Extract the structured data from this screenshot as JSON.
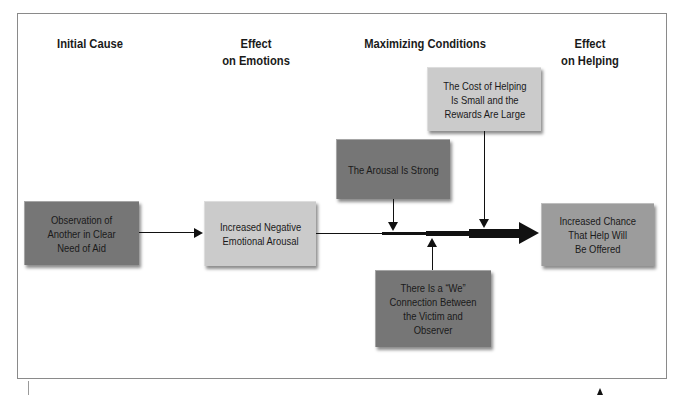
{
  "headers": {
    "initial_cause": "Initial Cause",
    "effect_on_emotions": "Effect\non Emotions",
    "maximizing_conditions": "Maximizing Conditions",
    "effect_on_helping": "Effect\non Helping"
  },
  "boxes": {
    "observation": "Observation of\nAnother in Clear\nNeed of Aid",
    "negative_arousal": "Increased Negative\nEmotional Arousal",
    "cost_small": "The Cost of Helping\nIs Small and the\nRewards Are Large",
    "arousal_strong": "The Arousal Is Strong",
    "we_connection": "There Is a “We”\nConnection Between\nthe Victim and\nObserver",
    "increased_chance": "Increased Chance\nThat Help Will\nBe Offered"
  },
  "colors": {
    "dark_box": "#767676",
    "light_box": "#cbcbcb",
    "mid_box": "#9c9c9c",
    "arrow": "#111111"
  }
}
